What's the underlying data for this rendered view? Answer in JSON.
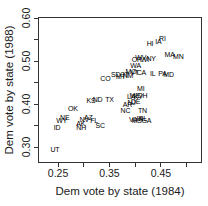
{
  "chart_data": {
    "type": "scatter",
    "title": "",
    "xlabel": "Dem vote by state (1984)",
    "ylabel": "Dem vote by state (1988)",
    "marker": "state-abbreviation-text",
    "grid": false,
    "legend": "none",
    "xlim": [
      0.211,
      0.53
    ],
    "ylim": [
      0.263,
      0.603
    ],
    "x_ticks_labeled": [
      0.25,
      0.35,
      0.45
    ],
    "x_ticks_minor": [
      0.3,
      0.4,
      0.5
    ],
    "y_ticks_labeled": [
      0.3,
      0.4,
      0.5,
      0.6
    ],
    "y_ticks_minor": [
      0.35,
      0.45,
      0.55
    ],
    "points": [
      {
        "label": "UT",
        "x": 0.244,
        "y": 0.296
      },
      {
        "label": "ID",
        "x": 0.248,
        "y": 0.347
      },
      {
        "label": "AK",
        "x": 0.294,
        "y": 0.357
      },
      {
        "label": "NH",
        "x": 0.295,
        "y": 0.346
      },
      {
        "label": "WY",
        "x": 0.257,
        "y": 0.362
      },
      {
        "label": "NE",
        "x": 0.263,
        "y": 0.37
      },
      {
        "label": "NV",
        "x": 0.301,
        "y": 0.366
      },
      {
        "label": "AZ",
        "x": 0.309,
        "y": 0.37
      },
      {
        "label": "FL",
        "x": 0.32,
        "y": 0.362
      },
      {
        "label": "SC",
        "x": 0.332,
        "y": 0.352
      },
      {
        "label": "OK",
        "x": 0.279,
        "y": 0.39
      },
      {
        "label": "KS",
        "x": 0.314,
        "y": 0.41
      },
      {
        "label": "ND",
        "x": 0.327,
        "y": 0.411
      },
      {
        "label": "TX",
        "x": 0.35,
        "y": 0.411
      },
      {
        "label": "NC",
        "x": 0.381,
        "y": 0.387
      },
      {
        "label": "TN",
        "x": 0.414,
        "y": 0.386
      },
      {
        "label": "VA",
        "x": 0.396,
        "y": 0.366
      },
      {
        "label": "MS",
        "x": 0.403,
        "y": 0.363
      },
      {
        "label": "IN",
        "x": 0.409,
        "y": 0.368
      },
      {
        "label": "AL",
        "x": 0.415,
        "y": 0.367
      },
      {
        "label": "GA",
        "x": 0.422,
        "y": 0.362
      },
      {
        "label": "AR",
        "x": 0.385,
        "y": 0.401
      },
      {
        "label": "NJ",
        "x": 0.393,
        "y": 0.405
      },
      {
        "label": "DE",
        "x": 0.401,
        "y": 0.408
      },
      {
        "label": "LA",
        "x": 0.392,
        "y": 0.419
      },
      {
        "label": "ME",
        "x": 0.399,
        "y": 0.422
      },
      {
        "label": "KY",
        "x": 0.406,
        "y": 0.42
      },
      {
        "label": "OH",
        "x": 0.414,
        "y": 0.421
      },
      {
        "label": "MI",
        "x": 0.411,
        "y": 0.437
      },
      {
        "label": "CO",
        "x": 0.342,
        "y": 0.462
      },
      {
        "label": "SD",
        "x": 0.362,
        "y": 0.47
      },
      {
        "label": "MT",
        "x": 0.372,
        "y": 0.466
      },
      {
        "label": "CT",
        "x": 0.379,
        "y": 0.471
      },
      {
        "label": "NM",
        "x": 0.386,
        "y": 0.469
      },
      {
        "label": "MO",
        "x": 0.392,
        "y": 0.477
      },
      {
        "label": "VT",
        "x": 0.399,
        "y": 0.474
      },
      {
        "label": "CA",
        "x": 0.412,
        "y": 0.474
      },
      {
        "label": "WA",
        "x": 0.401,
        "y": 0.491
      },
      {
        "label": "OR",
        "x": 0.403,
        "y": 0.506
      },
      {
        "label": "WV",
        "x": 0.411,
        "y": 0.511
      },
      {
        "label": "WI",
        "x": 0.419,
        "y": 0.506
      },
      {
        "label": "NY",
        "x": 0.431,
        "y": 0.508
      },
      {
        "label": "IL",
        "x": 0.434,
        "y": 0.473
      },
      {
        "label": "PA",
        "x": 0.453,
        "y": 0.472
      },
      {
        "label": "MD",
        "x": 0.465,
        "y": 0.471
      },
      {
        "label": "HI",
        "x": 0.429,
        "y": 0.542
      },
      {
        "label": "IA",
        "x": 0.445,
        "y": 0.547
      },
      {
        "label": "RI",
        "x": 0.453,
        "y": 0.553
      },
      {
        "label": "MA",
        "x": 0.467,
        "y": 0.517
      },
      {
        "label": "MN",
        "x": 0.484,
        "y": 0.513
      }
    ]
  },
  "styles": {
    "background": "#ffffff",
    "box_color": "#333333",
    "text_color": "#1a1a1a",
    "point_text_color": "#000000"
  }
}
